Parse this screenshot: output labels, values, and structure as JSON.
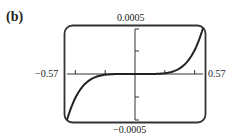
{
  "panel": {
    "label": "(b)"
  },
  "window": {
    "ymax_label": "0.0005",
    "ymin_label": "−0.0005",
    "xmin_label": "−0.57",
    "xmax_label": "0.57"
  },
  "colors": {
    "frame": "#333333",
    "curve": "#222222",
    "axis": "#333333"
  },
  "chart_data": {
    "type": "line",
    "title": "(b)",
    "xlabel": "",
    "ylabel": "",
    "xlim": [
      -0.57,
      0.57
    ],
    "ylim": [
      -0.0005,
      0.0005
    ],
    "x_ticks": [
      -0.5,
      -0.25,
      0.25,
      0.5
    ],
    "y_ticks": [
      -0.00025,
      0.00025
    ],
    "grid": false,
    "legend": null,
    "annotations": [
      "-0.57",
      "0.57",
      "0.0005",
      "-0.0005"
    ],
    "series": [
      {
        "name": "curve",
        "x": [
          -0.57,
          -0.5,
          -0.45,
          -0.4,
          -0.35,
          -0.3,
          -0.25,
          -0.2,
          -0.1,
          0,
          0.1,
          0.2,
          0.25,
          0.3,
          0.35,
          0.4,
          0.45,
          0.5,
          0.57
        ],
        "y": [
          -0.0005,
          -0.000259,
          -0.000153,
          -8.5e-05,
          -4.4e-05,
          -2e-05,
          -8e-06,
          -2.6e-06,
          -1e-07,
          0,
          1e-07,
          2.6e-06,
          8e-06,
          2e-05,
          4.4e-05,
          8.5e-05,
          0.000153,
          0.000259,
          0.0005
        ]
      }
    ]
  }
}
